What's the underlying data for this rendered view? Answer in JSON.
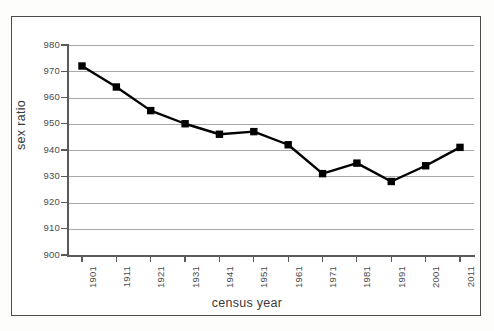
{
  "chart_data": {
    "type": "line",
    "title": "",
    "xlabel": "census year",
    "ylabel": "sex ratio",
    "categories": [
      "1901",
      "1911",
      "1921",
      "1931",
      "1941",
      "1951",
      "1961",
      "1971",
      "1981",
      "1991",
      "2001",
      "2011"
    ],
    "values": [
      972,
      964,
      955,
      950,
      946,
      947,
      942,
      931,
      935,
      928,
      934,
      941
    ],
    "series": [
      {
        "name": "sex ratio",
        "values": [
          972,
          964,
          955,
          950,
          946,
          947,
          942,
          931,
          935,
          928,
          934,
          941
        ]
      }
    ],
    "ylim": [
      900,
      980
    ],
    "yticks": [
      900,
      910,
      920,
      930,
      940,
      950,
      960,
      970,
      980
    ],
    "ytick_labels": [
      "900",
      "910",
      "920",
      "930",
      "940",
      "950",
      "960",
      "970",
      "980"
    ],
    "xtick_labels": [
      "1901",
      "1911",
      "1921",
      "1931",
      "1941",
      "1951",
      "1961",
      "1971",
      "1981",
      "1991",
      "2001",
      "2011"
    ],
    "grid": "horizontal",
    "legend": "none",
    "marker": "square",
    "marker_color": "#000000",
    "line_color": "#000000",
    "plot_background": "#ffffff",
    "gridline_color": "#a9a9a9",
    "axis_color": "#5a5a5a",
    "frame_color": "#4a4a4a"
  },
  "axis_titles": {
    "y": "sex ratio",
    "x": "census year"
  }
}
